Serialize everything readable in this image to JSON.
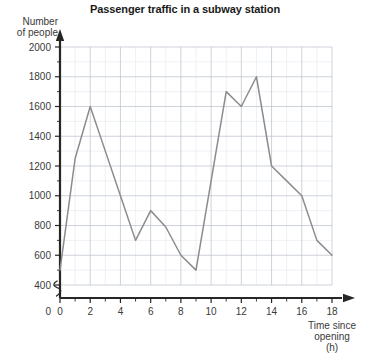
{
  "chart_data": {
    "type": "line",
    "title": "Passenger traffic in a subway station",
    "ylabel": "Number of people",
    "xlabel": "Time since opening (h)",
    "xlabel_lines": [
      "Time since",
      "opening",
      "(h)"
    ],
    "ylabel_lines": [
      "Number",
      "of people"
    ],
    "x": [
      0,
      1,
      2,
      3,
      4,
      5,
      6,
      7,
      8,
      9,
      10,
      11,
      12,
      13,
      14,
      15,
      16,
      17,
      18
    ],
    "values": [
      500,
      1250,
      1600,
      1300,
      1000,
      700,
      900,
      790,
      600,
      500,
      1100,
      1700,
      1600,
      1800,
      1200,
      1100,
      1000,
      700,
      600
    ],
    "series": [
      {
        "name": "Passengers",
        "values": [
          500,
          1250,
          1600,
          1300,
          1000,
          700,
          900,
          790,
          600,
          500,
          1100,
          1700,
          1600,
          1800,
          1200,
          1100,
          1000,
          700,
          600
        ]
      }
    ],
    "xlim": [
      0,
      18
    ],
    "ylim": [
      400,
      2000
    ],
    "y_axis_broken": true,
    "y_break_label": "0",
    "ytick_labels": [
      "400",
      "600",
      "800",
      "1000",
      "1200",
      "1400",
      "1600",
      "1800",
      "2000"
    ],
    "ytick_values": [
      400,
      600,
      800,
      1000,
      1200,
      1400,
      1600,
      1800,
      2000
    ],
    "y_minor_step": 100,
    "xtick_labels": [
      "0",
      "2",
      "4",
      "6",
      "8",
      "10",
      "12",
      "14",
      "16",
      "18"
    ],
    "xtick_values": [
      0,
      2,
      4,
      6,
      8,
      10,
      12,
      14,
      16,
      18
    ],
    "x_minor_step": 1,
    "grid": true,
    "legend": "none",
    "line_color": "#8c8c8c",
    "grid_major_color": "#b9c0cc",
    "grid_minor_color": "#e3e7ee",
    "axis_color": "#262626"
  }
}
